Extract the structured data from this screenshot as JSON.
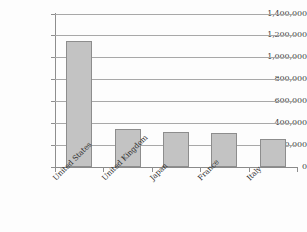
{
  "chart_data": {
    "type": "bar",
    "title": "",
    "subtitle": "",
    "xlabel": "",
    "ylabel": "",
    "categories": [
      "United States",
      "United Kingdom",
      "Japan",
      "France",
      "Italy"
    ],
    "values": [
      1150000,
      345000,
      315000,
      305000,
      250000
    ],
    "series": [
      {
        "name": "",
        "values": [
          1150000,
          345000,
          315000,
          305000,
          250000
        ]
      }
    ],
    "ylim": [
      0,
      1400000
    ],
    "ytick_values": [
      0,
      200000,
      400000,
      600000,
      800000,
      1000000,
      1200000,
      1400000
    ],
    "ytick_labels": [
      "0",
      "200,000",
      "400,000",
      "600,000",
      "800,000",
      "1,000,000",
      "1,200,000",
      "1,400,000"
    ],
    "grid": true,
    "grid_axis": "y",
    "legend": false,
    "legend_position": "none",
    "bar_fill_color": "#c3c3c3",
    "bar_edge_color": "#8d8d8d",
    "gridline_color": "#a8a8a8",
    "axis_color": "#8e8e8e",
    "background_color": "#fdfdfd",
    "label_color": "#3d3d3d",
    "xtick_label_rotation": -45
  }
}
